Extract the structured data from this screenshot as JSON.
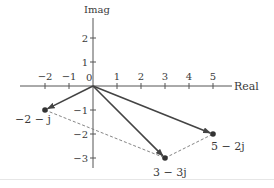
{
  "diagram": {
    "type": "complex-plane-vector-diagram",
    "axes": {
      "x_label": "Real",
      "y_label": "Imag",
      "origin_label": "0",
      "x_ticks": [
        {
          "value": -2,
          "label": "−2"
        },
        {
          "value": -1,
          "label": "−1"
        },
        {
          "value": 1,
          "label": "1"
        },
        {
          "value": 2,
          "label": "2"
        },
        {
          "value": 3,
          "label": "3"
        },
        {
          "value": 4,
          "label": "4"
        },
        {
          "value": 5,
          "label": "5"
        }
      ],
      "y_ticks": [
        {
          "value": 2,
          "label": "2"
        },
        {
          "value": 1,
          "label": "1"
        },
        {
          "value": -1,
          "label": "−1"
        },
        {
          "value": -2,
          "label": "−2"
        },
        {
          "value": -3,
          "label": "−3"
        }
      ]
    },
    "points": [
      {
        "re": -2,
        "im": -1,
        "label": "−2 − j"
      },
      {
        "re": 3,
        "im": -3,
        "label": "3 − 3j"
      },
      {
        "re": 5,
        "im": -2,
        "label": "5 − 2j"
      }
    ],
    "vectors": [
      {
        "from": "origin",
        "to": "−2 − j",
        "style": "solid-arrow"
      },
      {
        "from": "origin",
        "to": "3 − 3j",
        "style": "solid-arrow"
      },
      {
        "from": "origin",
        "to": "5 − 2j",
        "style": "solid-arrow"
      }
    ],
    "dashed_segments": [
      {
        "from": "−2 − j",
        "to": "3 − 3j"
      },
      {
        "from": "3 − 3j",
        "to": "5 − 2j"
      }
    ],
    "colors": {
      "axis": "#555555",
      "vector": "#444444",
      "dashed": "#777777",
      "point": "#333333"
    }
  }
}
